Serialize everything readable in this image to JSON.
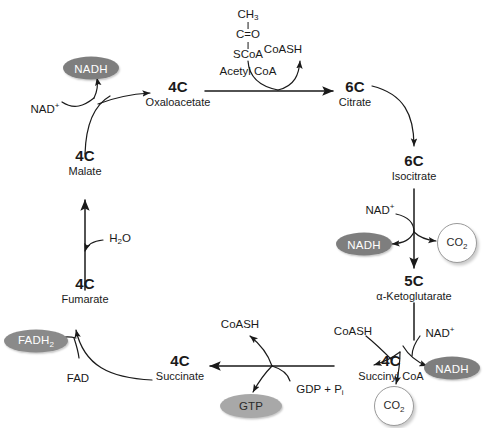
{
  "diagram": {
    "background_color": "#ffffff",
    "stroke_color": "#1a1a1a",
    "badge_fill_nadh": "#7e7e7e",
    "badge_fill_fadh2": "#8a8a8a",
    "badge_fill_gtp": "#a8a8a8",
    "ring_stroke": "#9a9a9a"
  },
  "nodes": [
    {
      "id": "oxaloacetate",
      "carbon": "4C",
      "name": "Oxaloacetate"
    },
    {
      "id": "citrate",
      "carbon": "6C",
      "name": "Citrate"
    },
    {
      "id": "isocitrate",
      "carbon": "6C",
      "name": "Isocitrate"
    },
    {
      "id": "ketoglutarate",
      "carbon": "5C",
      "name": "α-Ketoglutarate"
    },
    {
      "id": "succinyl-coa",
      "carbon": "4C",
      "name": "Succinyl CoA"
    },
    {
      "id": "succinate",
      "carbon": "4C",
      "name": "Succinate"
    },
    {
      "id": "fumarate",
      "carbon": "4C",
      "name": "Fumarate"
    },
    {
      "id": "malate",
      "carbon": "4C",
      "name": "Malate"
    }
  ],
  "structure": {
    "line1": "CH",
    "line1_sub": "3",
    "line2": "C=O",
    "line3": "SCoA",
    "name": "Acetyl CoA"
  },
  "cofactors": {
    "coash_top": "CoASH",
    "coash_bottom_left": "CoASH",
    "coash_bottom_right": "CoASH",
    "nad_plus_malate": "NAD",
    "nad_plus_malate_sup": "+",
    "nad_plus_isocitrate": "NAD",
    "nad_plus_isocitrate_sup": "+",
    "nad_plus_ketoglutarate": "NAD",
    "nad_plus_ketoglutarate_sup": "+",
    "water": "H",
    "water_sub": "2",
    "water_tail": "O",
    "fad": "FAD",
    "gdp": "GDP + P",
    "gdp_sub": "i"
  },
  "products": {
    "nadh_malate": "NADH",
    "nadh_isocitrate": "NADH",
    "nadh_ketoglutarate": "NADH",
    "fadh2": "FADH",
    "fadh2_sub": "2",
    "gtp": "GTP",
    "co2_isocitrate": "CO",
    "co2_isocitrate_sub": "2",
    "co2_ketoglutarate": "CO",
    "co2_ketoglutarate_sub": "2"
  }
}
